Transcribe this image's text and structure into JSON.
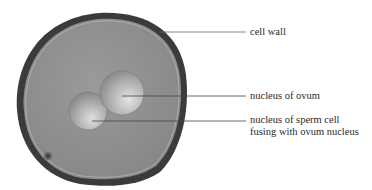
{
  "diagram": {
    "colors": {
      "background": "#ffffff",
      "cell_wall": "#3b3b3b",
      "cytoplasm": "#8f8f8f",
      "nucleus_highlight": "#d8d8d8",
      "nucleus_shadow": "#7a7a7a",
      "leader_line": "#555555",
      "label_text": "#2a2a2a"
    },
    "labels": [
      {
        "id": "cell_wall",
        "text": "cell wall"
      },
      {
        "id": "nucleus_ovum",
        "text": "nucleus of ovum"
      },
      {
        "id": "nucleus_sperm",
        "line1": "nucleus of sperm cell",
        "line2": "fusing with ovum nucleus"
      }
    ]
  }
}
